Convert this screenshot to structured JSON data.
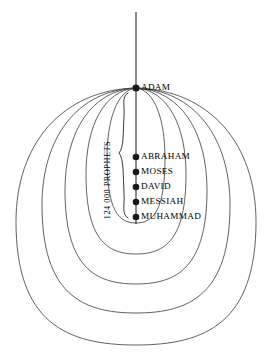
{
  "diagram": {
    "axis": {
      "name": "vertical-axis-line",
      "x": 136,
      "y_top": 12,
      "y_bottom": 224
    },
    "origin_node": {
      "label": "ADAM",
      "x": 136,
      "y": 88,
      "dot_radius": 3.6,
      "label_x": 141,
      "label_y": 88
    },
    "prophet_nodes": [
      {
        "label": "ABRAHAM",
        "x": 136,
        "y": 157,
        "dot_radius": 3.3,
        "label_x": 141,
        "label_y": 157
      },
      {
        "label": "MOSES",
        "x": 136,
        "y": 172,
        "dot_radius": 3.3,
        "label_x": 141,
        "label_y": 172
      },
      {
        "label": "DAVID",
        "x": 136,
        "y": 187,
        "dot_radius": 3.3,
        "label_x": 141,
        "label_y": 187
      },
      {
        "label": "MESSIAH",
        "x": 136,
        "y": 202,
        "dot_radius": 3.3,
        "label_x": 141,
        "label_y": 202
      },
      {
        "label": "MUHAMMAD",
        "x": 136,
        "y": 217,
        "dot_radius": 3.3,
        "label_x": 141,
        "label_y": 217
      }
    ],
    "brace": {
      "label": "124 000 PROPHETS",
      "label_x": 110,
      "label_y": 180,
      "rotation_deg": -90,
      "path": "M 128 93 C 121 97 125 106 124 116 C 123 133 124 147 119 153 C 124 159 123 176 124 193 C 125 205 121 214 128 218"
    },
    "loops": [
      {
        "name": "loop-1",
        "half_width": 29,
        "bottom_y": 223,
        "stroke_width": 0.85
      },
      {
        "name": "loop-2",
        "half_width": 50,
        "bottom_y": 254,
        "stroke_width": 0.85
      },
      {
        "name": "loop-3",
        "half_width": 71,
        "bottom_y": 284,
        "stroke_width": 0.85
      },
      {
        "name": "loop-4",
        "half_width": 94,
        "bottom_y": 313,
        "stroke_width": 0.85
      },
      {
        "name": "loop-5",
        "half_width": 120,
        "bottom_y": 345,
        "stroke_width": 0.85
      }
    ],
    "style": {
      "ink_color": "#1a1a1a",
      "curve_color": "#444444",
      "background": "#ffffff",
      "axis_stroke_width": 1.0
    }
  }
}
